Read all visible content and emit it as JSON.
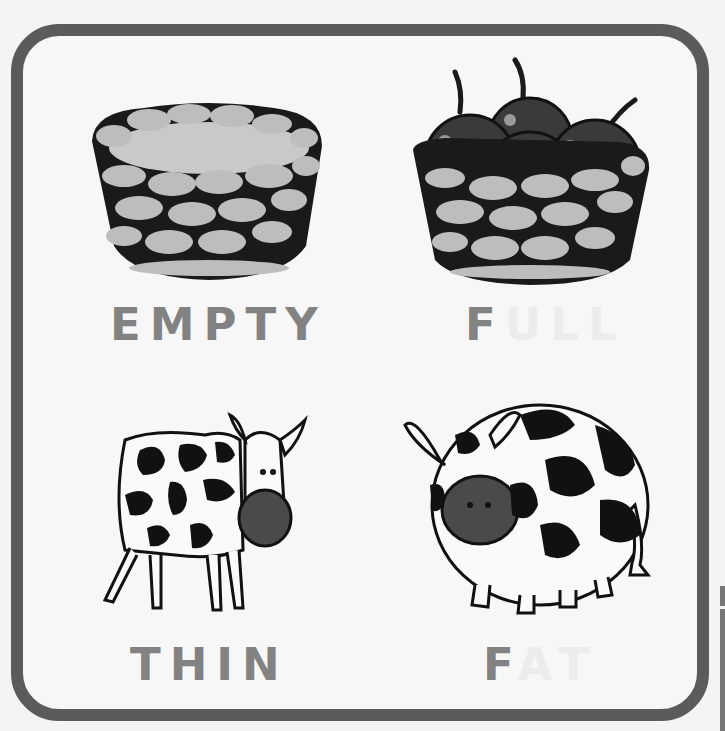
{
  "worksheet": {
    "topic": "opposites",
    "frame_color": "#5b5b5b",
    "label_color": "#828282",
    "label_faint_color": "#ececec",
    "cells": [
      {
        "id": "empty",
        "picture": "empty-basket",
        "label": "EMPTY",
        "label_visible": "EMPTY",
        "label_faint": ""
      },
      {
        "id": "full",
        "picture": "basket-of-apples",
        "label": "FULL",
        "label_visible": "F",
        "label_faint": "ULL"
      },
      {
        "id": "thin",
        "picture": "thin-cow",
        "label": "THIN",
        "label_visible": "THIN",
        "label_faint": ""
      },
      {
        "id": "fat",
        "picture": "fat-cow",
        "label": "FAT",
        "label_visible": "F",
        "label_faint": "AT"
      }
    ]
  }
}
